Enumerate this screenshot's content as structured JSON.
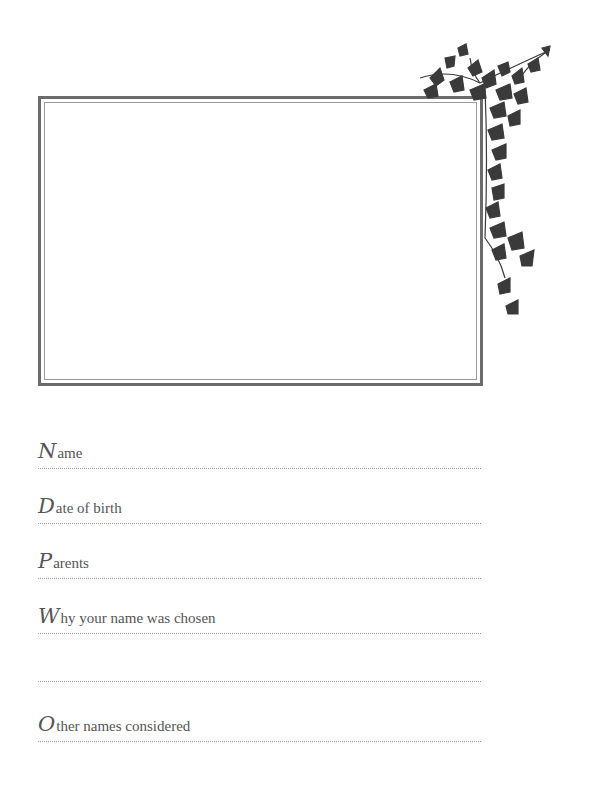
{
  "photo_frame": {
    "label": ""
  },
  "fields": [
    {
      "initial": "N",
      "rest": "ame",
      "line_y": 469
    },
    {
      "initial": "D",
      "rest": "ate of birth",
      "line_y": 524
    },
    {
      "initial": "P",
      "rest": "arents",
      "line_y": 579
    },
    {
      "initial": "W",
      "rest": "hy your name was chosen",
      "line_y": 634
    },
    {
      "initial": "",
      "rest": "",
      "line_y": 682
    },
    {
      "initial": "O",
      "rest": "ther names considered",
      "line_y": 742
    }
  ],
  "colors": {
    "frame": "#6b6b6b",
    "ivy": "#3a3a3a",
    "text": "#555555"
  }
}
